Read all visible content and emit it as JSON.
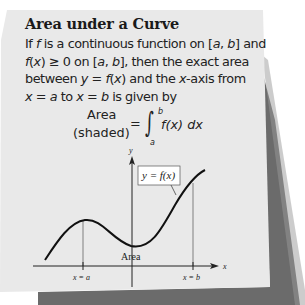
{
  "card": {
    "title": "Area under a Curve",
    "lines": [
      [
        "If ",
        "f",
        " is a continuous function on [",
        "a",
        ", ",
        "b",
        "] and"
      ],
      [
        "f",
        "(",
        "x",
        ") ≥ 0 on [",
        "a",
        ", ",
        "b",
        "], then the exact area"
      ],
      [
        "between ",
        "y",
        " = ",
        "f",
        "(",
        "x",
        ") and the ",
        "x",
        "-axis from"
      ],
      [
        "x",
        " = ",
        "a",
        " to ",
        "x",
        " = ",
        "b",
        " is given by"
      ]
    ],
    "formula": {
      "label_line1": "Area",
      "label_line2": "(shaded)",
      "equals": "=",
      "integral": "∫",
      "upper_limit": "b",
      "lower_limit": "a",
      "integrand": "f(x) dx"
    }
  },
  "graph": {
    "y_axis_label": "y",
    "x_axis_label": "x",
    "curve_label": "y = f(x)",
    "area_label": "Area",
    "tick_a_label": "x = a",
    "tick_b_label": "x = b"
  },
  "colors": {
    "background": "#ffffff",
    "card": "#e9e9e9",
    "shadow": "#6b6b6b",
    "ink": "#1a1a1a"
  }
}
